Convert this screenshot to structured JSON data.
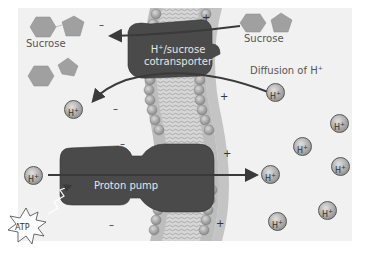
{
  "diagram": {
    "labels": {
      "sucrose_left": "Sucrose",
      "sucrose_right": "Sucrose",
      "cotransporter_line1": "H⁺/sucrose",
      "cotransporter_line2": "cotransporter",
      "diffusion": "Diffusion of H⁺",
      "proton_pump": "Proton pump",
      "atp": "ATP"
    },
    "ion_label": "H",
    "ion_charge": "+",
    "signs": {
      "minus": "–",
      "plus": "+"
    },
    "colors": {
      "background": "#f1f1f1",
      "protein": "#4a4a4a",
      "membrane_head": "#a8a8a8",
      "sucrose": "#a0a0a0",
      "arrow": "#3a3a3a"
    }
  }
}
